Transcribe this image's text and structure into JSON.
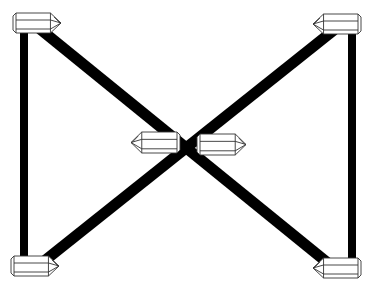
{
  "diagram": {
    "description": "Line-art diagram: six hexagonal crystal prisms connected by thick black bars forming a rectangle's vertical sides plus an X through the center",
    "background": "#ffffff",
    "bar_color": "#000000",
    "crystal_outline_color": "#333333",
    "crystal_fill": "#ffffff",
    "bars": [
      {
        "id": "left-vertical",
        "x1": 24,
        "y1": 30,
        "x2": 24,
        "y2": 258,
        "width": 8
      },
      {
        "id": "right-vertical",
        "x1": 352,
        "y1": 30,
        "x2": 352,
        "y2": 260,
        "width": 8
      },
      {
        "id": "diagonal-tl-br",
        "x1": 40,
        "y1": 29,
        "x2": 334,
        "y2": 268,
        "width": 11
      },
      {
        "id": "diagonal-tr-bl",
        "x1": 334,
        "y1": 30,
        "x2": 38,
        "y2": 266,
        "width": 11
      }
    ],
    "crystals": [
      {
        "id": "top-left",
        "x": 13,
        "y": 13,
        "w": 48,
        "h": 20,
        "point": "right"
      },
      {
        "id": "top-right",
        "x": 313,
        "y": 14,
        "w": 48,
        "h": 20,
        "point": "left"
      },
      {
        "id": "bottom-left",
        "x": 11,
        "y": 256,
        "w": 48,
        "h": 20,
        "point": "right"
      },
      {
        "id": "bottom-right",
        "x": 313,
        "y": 258,
        "w": 48,
        "h": 20,
        "point": "left"
      },
      {
        "id": "center-left",
        "x": 131,
        "y": 132,
        "w": 49,
        "h": 21,
        "point": "left"
      },
      {
        "id": "center-right",
        "x": 197,
        "y": 134,
        "w": 49,
        "h": 21,
        "point": "right"
      }
    ]
  }
}
